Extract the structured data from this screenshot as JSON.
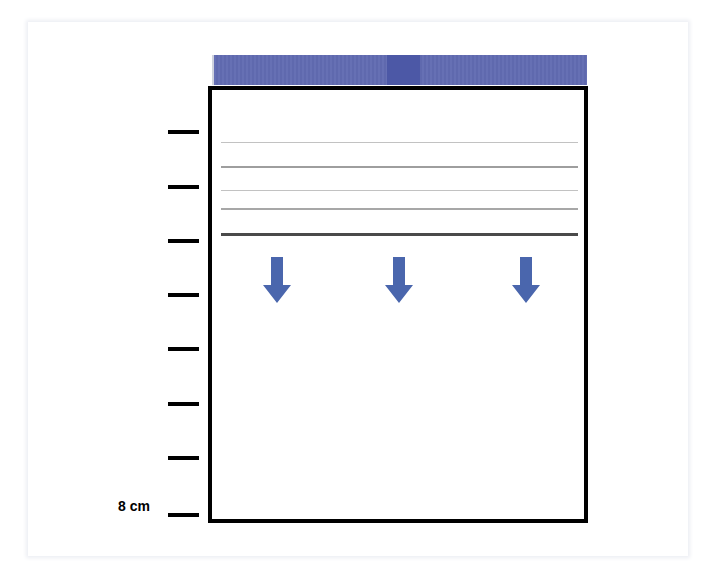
{
  "colors": {
    "band": "#6670b4",
    "band_dark": "#4c58a6",
    "arrow": "#4a66ad",
    "box_border": "#000000",
    "tick": "#000000"
  },
  "scale": {
    "tick_count": 8,
    "tick_y": [
      130,
      185,
      239,
      293,
      347,
      402,
      456,
      513
    ],
    "bottom_label": "8 cm"
  },
  "band": {
    "description": "blue band above the container",
    "dark_segment": "darker stripe near center"
  },
  "layers": [
    {
      "y": 56,
      "thickness": 1,
      "color": "#c2c2c2"
    },
    {
      "y": 80,
      "thickness": 2,
      "color": "#9e9e9e"
    },
    {
      "y": 104,
      "thickness": 1,
      "color": "#c2c2c2"
    },
    {
      "y": 122,
      "thickness": 2,
      "color": "#a7a7a7"
    },
    {
      "y": 147,
      "thickness": 3,
      "color": "#4a4a4a"
    }
  ],
  "arrows": [
    {
      "x": 263,
      "y": 257,
      "direction": "down"
    },
    {
      "x": 385,
      "y": 257,
      "direction": "down"
    },
    {
      "x": 512,
      "y": 257,
      "direction": "down"
    }
  ]
}
